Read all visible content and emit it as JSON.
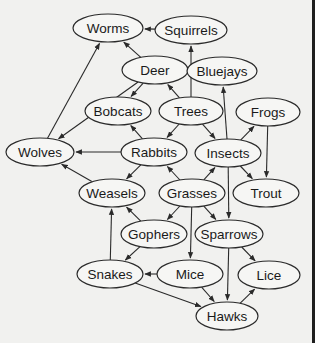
{
  "diagram": {
    "type": "food-web",
    "nodes": [
      {
        "id": "worms",
        "label": "Worms",
        "x": 108,
        "y": 28,
        "rx": 35,
        "ry": 14
      },
      {
        "id": "squirrels",
        "label": "Squirrels",
        "x": 191,
        "y": 30,
        "rx": 36,
        "ry": 14
      },
      {
        "id": "deer",
        "label": "Deer",
        "x": 155,
        "y": 70,
        "rx": 33,
        "ry": 14
      },
      {
        "id": "bluejays",
        "label": "Bluejays",
        "x": 222,
        "y": 71,
        "rx": 35,
        "ry": 14
      },
      {
        "id": "bobcats",
        "label": "Bobcats",
        "x": 118,
        "y": 111,
        "rx": 33,
        "ry": 14
      },
      {
        "id": "trees",
        "label": "Trees",
        "x": 191,
        "y": 111,
        "rx": 32,
        "ry": 14
      },
      {
        "id": "frogs",
        "label": "Frogs",
        "x": 268,
        "y": 112,
        "rx": 32,
        "ry": 14
      },
      {
        "id": "wolves",
        "label": "Wolves",
        "x": 40,
        "y": 152,
        "rx": 34,
        "ry": 14
      },
      {
        "id": "rabbits",
        "label": "Rabbits",
        "x": 154,
        "y": 152,
        "rx": 33,
        "ry": 14
      },
      {
        "id": "insects",
        "label": "Insects",
        "x": 228,
        "y": 153,
        "rx": 33,
        "ry": 14
      },
      {
        "id": "weasels",
        "label": "Weasels",
        "x": 112,
        "y": 193,
        "rx": 33,
        "ry": 14
      },
      {
        "id": "grasses",
        "label": "Grasses",
        "x": 192,
        "y": 193,
        "rx": 33,
        "ry": 14
      },
      {
        "id": "trout",
        "label": "Trout",
        "x": 266,
        "y": 193,
        "rx": 33,
        "ry": 14
      },
      {
        "id": "gophers",
        "label": "Gophers",
        "x": 154,
        "y": 234,
        "rx": 33,
        "ry": 14
      },
      {
        "id": "sparrows",
        "label": "Sparrows",
        "x": 229,
        "y": 234,
        "rx": 34,
        "ry": 14
      },
      {
        "id": "snakes",
        "label": "Snakes",
        "x": 110,
        "y": 274,
        "rx": 33,
        "ry": 14
      },
      {
        "id": "mice",
        "label": "Mice",
        "x": 190,
        "y": 274,
        "rx": 33,
        "ry": 14
      },
      {
        "id": "lice",
        "label": "Lice",
        "x": 269,
        "y": 275,
        "rx": 31,
        "ry": 14
      },
      {
        "id": "hawks",
        "label": "Hawks",
        "x": 227,
        "y": 316,
        "rx": 31,
        "ry": 14
      }
    ],
    "edges": [
      {
        "from": "squirrels",
        "to": "worms"
      },
      {
        "from": "trees",
        "to": "squirrels"
      },
      {
        "from": "deer",
        "to": "worms"
      },
      {
        "from": "deer",
        "to": "bobcats"
      },
      {
        "from": "deer",
        "to": "wolves"
      },
      {
        "from": "wolves",
        "to": "worms"
      },
      {
        "from": "trees",
        "to": "deer"
      },
      {
        "from": "trees",
        "to": "rabbits"
      },
      {
        "from": "trees",
        "to": "insects"
      },
      {
        "from": "rabbits",
        "to": "bobcats"
      },
      {
        "from": "rabbits",
        "to": "wolves"
      },
      {
        "from": "rabbits",
        "to": "weasels"
      },
      {
        "from": "weasels",
        "to": "wolves"
      },
      {
        "from": "insects",
        "to": "bluejays"
      },
      {
        "from": "insects",
        "to": "frogs"
      },
      {
        "from": "insects",
        "to": "trout"
      },
      {
        "from": "frogs",
        "to": "trout"
      },
      {
        "from": "insects",
        "to": "sparrows"
      },
      {
        "from": "grasses",
        "to": "rabbits"
      },
      {
        "from": "grasses",
        "to": "insects"
      },
      {
        "from": "grasses",
        "to": "gophers"
      },
      {
        "from": "grasses",
        "to": "sparrows"
      },
      {
        "from": "grasses",
        "to": "mice"
      },
      {
        "from": "gophers",
        "to": "weasels"
      },
      {
        "from": "gophers",
        "to": "snakes"
      },
      {
        "from": "snakes",
        "to": "weasels"
      },
      {
        "from": "mice",
        "to": "snakes"
      },
      {
        "from": "mice",
        "to": "hawks"
      },
      {
        "from": "snakes",
        "to": "hawks"
      },
      {
        "from": "sparrows",
        "to": "hawks"
      },
      {
        "from": "sparrows",
        "to": "lice"
      },
      {
        "from": "hawks",
        "to": "lice"
      }
    ]
  },
  "colors": {
    "background": "#f1f1ef",
    "stroke": "#2a2a2a",
    "text": "#1a1a1a",
    "right_edge_bar": "#1e1e1e"
  }
}
